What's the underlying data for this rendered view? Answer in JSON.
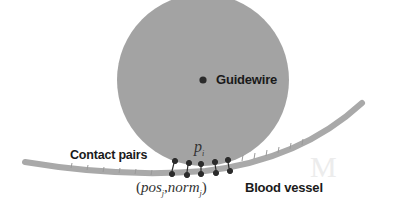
{
  "diagram": {
    "labels": {
      "guidewire": "Guidewire",
      "contact_pairs": "Contact pairs",
      "blood_vessel": "Blood vessel",
      "point_label": "p",
      "point_subscript": "i",
      "pair_label_open": "(",
      "pos": "pos",
      "pos_sub": "j",
      "separator": ",",
      "norm": "norm",
      "norm_sub": "j",
      "pair_label_close": ")"
    },
    "background_ghost_text": [
      "...",
      "M"
    ],
    "colors": {
      "guidewire_fill": "#a3a3a3",
      "vessel_stroke": "#a9a9a9",
      "contact_points": "#2b2b2b",
      "label_text": "#1a1a1a",
      "background": "#ffffff"
    },
    "contact_pair_count": 5
  }
}
